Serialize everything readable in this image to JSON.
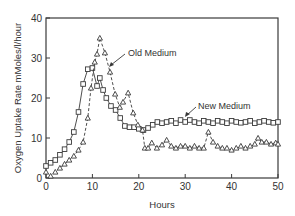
{
  "chart_data": {
    "type": "line",
    "title": "",
    "xlabel": "Hours",
    "ylabel": "Oxygen Uptake Rate  mMoles/l/hour",
    "xlim": [
      0,
      50
    ],
    "ylim": [
      0,
      40
    ],
    "xticks": [
      0,
      10,
      20,
      30,
      40,
      50
    ],
    "yticks": [
      0,
      10,
      20,
      30,
      40
    ],
    "grid": false,
    "legend": "none (inline annotations with arrows)",
    "series": [
      {
        "name": "New Medium",
        "marker": "square",
        "line": "solid",
        "x": [
          0,
          1,
          2,
          3,
          4,
          5,
          6,
          7,
          8,
          9,
          10,
          11,
          11.6,
          12.3,
          13,
          14,
          15,
          16,
          17,
          18,
          19,
          20,
          21,
          22,
          23,
          24,
          25,
          26,
          27,
          28,
          29,
          30,
          31,
          32,
          33,
          34,
          35,
          36,
          37,
          38,
          39,
          40,
          41,
          42,
          43,
          44,
          45,
          46,
          47,
          48,
          49,
          50
        ],
        "values": [
          3,
          3.8,
          4.5,
          5.8,
          7.2,
          9,
          11.5,
          16.5,
          23.5,
          27.2,
          27.5,
          23,
          25,
          22,
          20,
          18,
          17,
          15,
          13,
          12.7,
          12.7,
          12.3,
          12,
          12.5,
          13.3,
          14,
          13.7,
          14,
          14.3,
          13.7,
          14.5,
          14,
          14.5,
          14,
          13.7,
          14.3,
          14,
          13.7,
          14.3,
          14,
          13.7,
          14.3,
          14,
          13.8,
          14,
          14.3,
          13.7,
          14,
          14.3,
          14,
          13.8,
          14
        ]
      },
      {
        "name": "Old Medium",
        "marker": "triangle",
        "line": "dashed",
        "x": [
          0,
          1,
          2,
          3,
          4,
          5,
          6,
          7,
          8,
          9,
          9.7,
          10.5,
          11,
          11.6,
          12.7,
          13.8,
          14.9,
          15.9,
          16.6,
          17.7,
          18.8,
          19.8,
          20.8,
          21.3,
          22,
          22.8,
          23.9,
          25,
          26,
          27,
          28,
          29,
          30,
          31,
          32,
          33,
          34,
          35,
          36,
          37,
          38,
          39,
          40,
          41,
          42,
          43,
          44,
          45,
          45.7,
          46.5,
          47.5,
          48.5,
          49.5,
          50
        ],
        "values": [
          1.5,
          0.5,
          1.5,
          2.5,
          3.5,
          4.5,
          5.5,
          7,
          9,
          15,
          22.5,
          29,
          31,
          35,
          31.3,
          26.5,
          21,
          17.7,
          19,
          21.3,
          16.3,
          13.3,
          12,
          7.5,
          7.5,
          8.8,
          7.5,
          8.3,
          9.5,
          8,
          7.5,
          8,
          8,
          7.5,
          8,
          7.5,
          7.5,
          11.5,
          9,
          8,
          7.5,
          7.5,
          7,
          7.5,
          8,
          7.5,
          8,
          8.5,
          10,
          9,
          9,
          8.5,
          8.8,
          8.5
        ]
      }
    ],
    "annotations": [
      {
        "text": "Old Medium",
        "arrow_to": [
          14.0,
          28.5
        ]
      },
      {
        "text": "New Medium",
        "arrow_to": [
          30.0,
          15.5
        ]
      }
    ]
  }
}
